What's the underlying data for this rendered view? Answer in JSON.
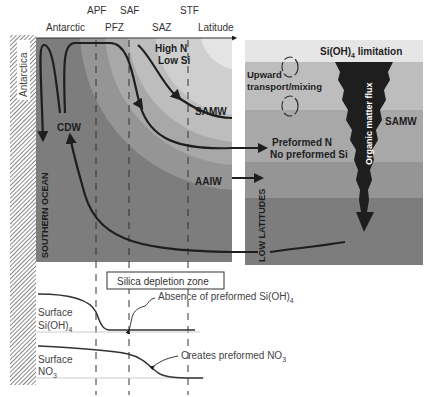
{
  "header": {
    "fronts": [
      "APF",
      "SAF",
      "STF"
    ],
    "zones": [
      "Antarctic",
      "PFZ",
      "SAZ"
    ],
    "axis_label": "Latitude"
  },
  "left_panel": {
    "land_label": "Antarctica",
    "ocean_label": "SOUTHERN OCEAN",
    "water_masses": {
      "cdw": "CDW",
      "samw": "SAMW",
      "aaiw": "AAIW"
    },
    "surface_note_1": "High N",
    "surface_note_2": "Low Si"
  },
  "right_panel": {
    "top_band_label": "Si(OH)",
    "top_band_sub": "4",
    "top_band_suffix": " limitation",
    "mixing_label_1": "Upward",
    "mixing_label_2": "transport/mixing",
    "samw_label": "SAMW",
    "preformed_1": "Preformed N",
    "preformed_2": "No preformed Si",
    "flux_label": "Organic matter flux",
    "low_lat_label": "LOW LATITUDES"
  },
  "bottom_panel": {
    "zone_box": "Silica depletion zone",
    "si_label_1": "Surface",
    "si_label_2": "Si(OH)",
    "si_sub": "4",
    "no3_label_1": "Surface",
    "no3_label_2": "NO",
    "no3_sub": "3",
    "annotation_si": "Absence of preformed Si(OH)",
    "annotation_si_sub": "4",
    "annotation_no3": "Creates preformed NO",
    "annotation_no3_sub": "3"
  },
  "colors": {
    "deep": "#7d7d7d",
    "band2": "#959595",
    "band3": "#a8a8a8",
    "band4": "#bdbdbd",
    "band5": "#d6d6d6",
    "surface": "#ececec",
    "ink": "#1e1e1e"
  }
}
